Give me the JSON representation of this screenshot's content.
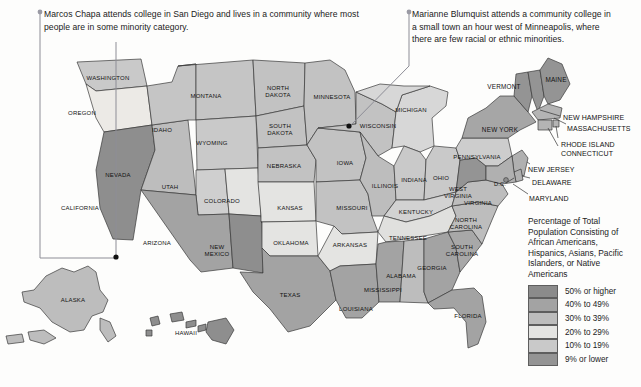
{
  "figure": {
    "type": "choropleth-map",
    "region": "United States"
  },
  "callouts": [
    {
      "id": "left",
      "name": "Marcos Chapa",
      "text": "Marcos Chapa attends college in San Diego and lives in a community where most people are in some minority category.",
      "target": "San Diego, California"
    },
    {
      "id": "right",
      "name": "Marianne Blumquist",
      "text": "Marianne Blumquist attends a community college in a small town an hour west of Minneapolis, where there are few racial or ethnic minorities.",
      "target": "Western Wisconsin / Minnesota border"
    }
  ],
  "legend": {
    "title": "Percentage of Total Population Consisting of African Americans, Hispanics, Asians, Pacific Islanders, or Native Americans",
    "items": [
      {
        "label": "50% or higher",
        "color": "#8b8b8b"
      },
      {
        "label": "40% to 49%",
        "color": "#a3a3a3"
      },
      {
        "label": "30% to 39%",
        "color": "#bdbdbd"
      },
      {
        "label": "20% to 29%",
        "color": "#e4e4e2"
      },
      {
        "label": "10% to 19%",
        "color": "#c9c9c9"
      },
      {
        "label": "9% or lower",
        "color": "#949494"
      }
    ]
  },
  "chart_data": {
    "type": "map",
    "title": "Percentage of Total Population Consisting of African Americans, Hispanics, Asians, Pacific Islanders, or Native Americans",
    "legend_position": "right",
    "categories": [
      "50% or higher",
      "40% to 49%",
      "30% to 39%",
      "20% to 29%",
      "10% to 19%",
      "9% or lower"
    ],
    "states": [
      {
        "name": "WASHINGTON",
        "abbr": "WA",
        "bin": "20% to 29%",
        "color": "#c9c9c9",
        "lx": 108,
        "ly": 78
      },
      {
        "name": "OREGON",
        "abbr": "OR",
        "bin": "10% to 19%",
        "color": "#eceae6",
        "lx": 82,
        "ly": 113
      },
      {
        "name": "CALIFORNIA",
        "abbr": "CA",
        "bin": "50% or higher",
        "color": "#8e8e8e",
        "lx": 80,
        "ly": 208
      },
      {
        "name": "NEVADA",
        "abbr": "NV",
        "bin": "30% to 39%",
        "color": "#bdbdbd",
        "lx": 118,
        "ly": 175
      },
      {
        "name": "IDAHO",
        "abbr": "ID",
        "bin": "10% to 19%",
        "color": "#c5c5c5",
        "lx": 162,
        "ly": 130
      },
      {
        "name": "MONTANA",
        "abbr": "MT",
        "bin": "10% to 19%",
        "color": "#c5c5c5",
        "lx": 206,
        "ly": 96
      },
      {
        "name": "WYOMING",
        "abbr": "WY",
        "bin": "10% to 19%",
        "color": "#c9c9c9",
        "lx": 212,
        "ly": 143
      },
      {
        "name": "UTAH",
        "abbr": "UT",
        "bin": "10% to 19%",
        "color": "#cfcfcf",
        "lx": 170,
        "ly": 187
      },
      {
        "name": "COLORADO",
        "abbr": "CO",
        "bin": "20% to 29%",
        "color": "#e4e4e2",
        "lx": 222,
        "ly": 201
      },
      {
        "name": "ARIZONA",
        "abbr": "AZ",
        "bin": "40% to 49%",
        "color": "#a3a3a3",
        "lx": 157,
        "ly": 243
      },
      {
        "name": "NEW MEXICO",
        "abbr": "NM",
        "bin": "50% or higher",
        "color": "#8e8e8e",
        "lx": 217,
        "ly": 251
      },
      {
        "name": "NORTH DAKOTA",
        "abbr": "ND",
        "bin": "10% to 19%",
        "color": "#c2c2c2",
        "lx": 278,
        "ly": 92
      },
      {
        "name": "SOUTH DAKOTA",
        "abbr": "SD",
        "bin": "10% to 19%",
        "color": "#c2c2c2",
        "lx": 280,
        "ly": 130
      },
      {
        "name": "NEBRASKA",
        "abbr": "NE",
        "bin": "10% to 19%",
        "color": "#c2c2c2",
        "lx": 284,
        "ly": 166
      },
      {
        "name": "KANSAS",
        "abbr": "KS",
        "bin": "20% to 29%",
        "color": "#e4e4e2",
        "lx": 290,
        "ly": 208
      },
      {
        "name": "OKLAHOMA",
        "abbr": "OK",
        "bin": "20% to 29%",
        "color": "#e4e4e2",
        "lx": 291,
        "ly": 243
      },
      {
        "name": "TEXAS",
        "abbr": "TX",
        "bin": "40% to 49%",
        "color": "#a3a3a3",
        "lx": 290,
        "ly": 295
      },
      {
        "name": "MINNESOTA",
        "abbr": "MN",
        "bin": "10% to 19%",
        "color": "#c2c2c2",
        "lx": 332,
        "ly": 97
      },
      {
        "name": "IOWA",
        "abbr": "IA",
        "bin": "10% to 19%",
        "color": "#c2c2c2",
        "lx": 345,
        "ly": 163
      },
      {
        "name": "MISSOURI",
        "abbr": "MO",
        "bin": "10% to 19%",
        "color": "#c2c2c2",
        "lx": 352,
        "ly": 208
      },
      {
        "name": "ARKANSAS",
        "abbr": "AR",
        "bin": "20% to 29%",
        "color": "#e4e4e2",
        "lx": 350,
        "ly": 245
      },
      {
        "name": "LOUISIANA",
        "abbr": "LA",
        "bin": "40% to 49%",
        "color": "#a3a3a3",
        "lx": 356,
        "ly": 309
      },
      {
        "name": "WISCONSIN",
        "abbr": "WI",
        "bin": "10% to 19%",
        "color": "#c2c2c2",
        "lx": 378,
        "ly": 126
      },
      {
        "name": "ILLINOIS",
        "abbr": "IL",
        "bin": "30% to 39%",
        "color": "#bdbdbd",
        "lx": 385,
        "ly": 186
      },
      {
        "name": "MICHIGAN",
        "abbr": "MI",
        "bin": "20% to 29%",
        "color": "#d7d7d7",
        "lx": 411,
        "ly": 110
      },
      {
        "name": "INDIANA",
        "abbr": "IN",
        "bin": "10% to 19%",
        "color": "#c9c9c9",
        "lx": 414,
        "ly": 180
      },
      {
        "name": "OHIO",
        "abbr": "OH",
        "bin": "10% to 19%",
        "color": "#c9c9c9",
        "lx": 441,
        "ly": 178
      },
      {
        "name": "KENTUCKY",
        "abbr": "KY",
        "bin": "10% to 19%",
        "color": "#d2d2d2",
        "lx": 416,
        "ly": 212
      },
      {
        "name": "TENNESSEE",
        "abbr": "TN",
        "bin": "20% to 29%",
        "color": "#e0e0de",
        "lx": 408,
        "ly": 238
      },
      {
        "name": "MISSISSIPPI",
        "abbr": "MS",
        "bin": "40% to 49%",
        "color": "#a3a3a3",
        "lx": 383,
        "ly": 290
      },
      {
        "name": "ALABAMA",
        "abbr": "AL",
        "bin": "30% to 39%",
        "color": "#bdbdbd",
        "lx": 401,
        "ly": 276
      },
      {
        "name": "GEORGIA",
        "abbr": "GA",
        "bin": "40% to 49%",
        "color": "#a3a3a3",
        "lx": 432,
        "ly": 268
      },
      {
        "name": "FLORIDA",
        "abbr": "FL",
        "bin": "40% to 49%",
        "color": "#a3a3a3",
        "lx": 468,
        "ly": 316
      },
      {
        "name": "SOUTH CAROLINA",
        "abbr": "SC",
        "bin": "40% to 49%",
        "color": "#a8a8a8",
        "lx": 462,
        "ly": 251
      },
      {
        "name": "NORTH CAROLINA",
        "abbr": "NC",
        "bin": "30% to 39%",
        "color": "#bdbdbd",
        "lx": 466,
        "ly": 224
      },
      {
        "name": "VIRGINIA",
        "abbr": "VA",
        "bin": "30% to 39%",
        "color": "#bdbdbd",
        "lx": 478,
        "ly": 203
      },
      {
        "name": "WEST VIRGINIA",
        "abbr": "WV",
        "bin": "9% or lower",
        "color": "#949494",
        "lx": 458,
        "ly": 193
      },
      {
        "name": "PENNSYLVANIA",
        "abbr": "PA",
        "bin": "10% to 19%",
        "color": "#cdcdcd",
        "lx": 477,
        "ly": 157
      },
      {
        "name": "NEW YORK",
        "abbr": "NY",
        "bin": "30% to 39%",
        "color": "#a6a6a6",
        "lx": 500,
        "ly": 130
      },
      {
        "name": "VERMONT",
        "abbr": "VT",
        "bin": "9% or lower",
        "color": "#949494",
        "lx": 504,
        "ly": 87
      },
      {
        "name": "MAINE",
        "abbr": "ME",
        "bin": "9% or lower",
        "color": "#949494",
        "lx": 556,
        "ly": 80
      },
      {
        "name": "NEW HAMPSHIRE",
        "abbr": "NH",
        "bin": "9% or lower",
        "color": "#949494",
        "lx": 566,
        "ly": 118
      },
      {
        "name": "MASSACHUSETTS",
        "abbr": "MA",
        "bin": "10% to 19%",
        "color": "#b4b4b4",
        "lx": 572,
        "ly": 129
      },
      {
        "name": "RHODE ISLAND",
        "abbr": "RI",
        "bin": "10% to 19%",
        "color": "#b4b4b4",
        "lx": 566,
        "ly": 145
      },
      {
        "name": "CONNECTICUT",
        "abbr": "CT",
        "bin": "10% to 19%",
        "color": "#b4b4b4",
        "lx": 564,
        "ly": 153
      },
      {
        "name": "NEW JERSEY",
        "abbr": "NJ",
        "bin": "30% to 39%",
        "color": "#b0b0b0",
        "lx": 553,
        "ly": 169
      },
      {
        "name": "DELAWARE",
        "abbr": "DE",
        "bin": "30% to 39%",
        "color": "#b0b0b0",
        "lx": 549,
        "ly": 181
      },
      {
        "name": "MARYLAND",
        "abbr": "MD",
        "bin": "30% to 39%",
        "color": "#b0b0b0",
        "lx": 549,
        "ly": 196
      },
      {
        "name": "D.C.",
        "abbr": "DC",
        "bin": "50% or higher",
        "color": "#8e8e8e",
        "lx": 500,
        "ly": 184
      },
      {
        "name": "ALASKA",
        "abbr": "AK",
        "bin": "30% to 39%",
        "color": "#bdbdbd",
        "lx": 73,
        "ly": 300
      },
      {
        "name": "HAWAII",
        "abbr": "HI",
        "bin": "50% or higher",
        "color": "#8e8e8e",
        "lx": 186,
        "ly": 333
      }
    ]
  },
  "inset_leader_labels": [
    {
      "text": "NEW HAMPSHIRE",
      "x": 563,
      "y": 114
    },
    {
      "text": "MASSACHUSETTS",
      "x": 567,
      "y": 125
    },
    {
      "text": "RHODE ISLAND",
      "x": 561,
      "y": 141
    },
    {
      "text": "CONNECTICUT",
      "x": 561,
      "y": 150
    },
    {
      "text": "NEW JERSEY",
      "x": 528,
      "y": 166
    },
    {
      "text": "DELAWARE",
      "x": 532,
      "y": 179
    },
    {
      "text": "MARYLAND",
      "x": 529,
      "y": 195
    }
  ]
}
